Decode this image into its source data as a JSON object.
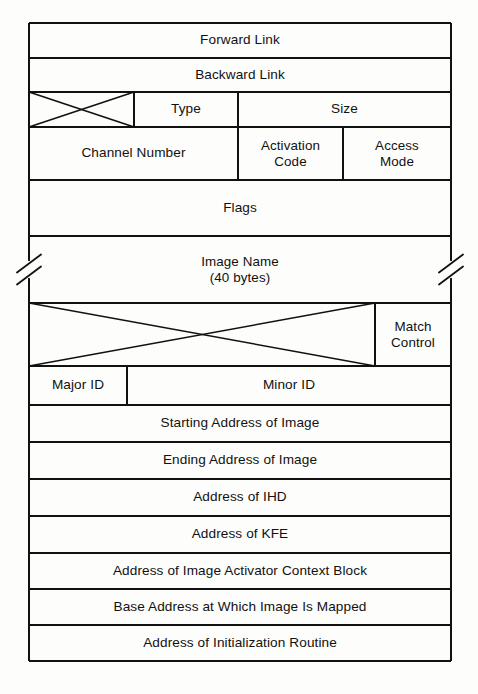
{
  "diagram": {
    "type": "memory-structure-layout",
    "colors": {
      "background": "#fdfdfb",
      "line": "#111111",
      "text": "#111111"
    },
    "geometry": {
      "left": 29,
      "right": 451,
      "top": 23,
      "bottom": 661
    },
    "rows": [
      {
        "name": "forward-link",
        "y": 23,
        "height": 35,
        "fields": [
          {
            "name": "forward-link",
            "label": "Forward Link",
            "x": 29,
            "width": 422,
            "kind": "text"
          }
        ]
      },
      {
        "name": "backward-link",
        "y": 58,
        "height": 34,
        "fields": [
          {
            "name": "backward-link",
            "label": "Backward Link",
            "x": 29,
            "width": 422,
            "kind": "text"
          }
        ]
      },
      {
        "name": "type-size",
        "y": 92,
        "height": 35,
        "fields": [
          {
            "name": "unused-crossed-box",
            "label": "",
            "x": 29,
            "width": 105,
            "kind": "crossed"
          },
          {
            "name": "type",
            "label": "Type",
            "x": 134,
            "width": 104,
            "kind": "text"
          },
          {
            "name": "size",
            "label": "Size",
            "x": 238,
            "width": 213,
            "kind": "text"
          }
        ]
      },
      {
        "name": "channel-activation-access",
        "y": 127,
        "height": 53,
        "fields": [
          {
            "name": "channel-number",
            "label": "Channel Number",
            "x": 29,
            "width": 209,
            "kind": "text"
          },
          {
            "name": "activation-code",
            "label": "Activation\nCode",
            "x": 238,
            "width": 105,
            "kind": "text"
          },
          {
            "name": "access-mode",
            "label": "Access\nMode",
            "x": 343,
            "width": 108,
            "kind": "text"
          }
        ]
      },
      {
        "name": "flags",
        "y": 180,
        "height": 56,
        "fields": [
          {
            "name": "flags",
            "label": "Flags",
            "x": 29,
            "width": 422,
            "kind": "text"
          }
        ]
      },
      {
        "name": "image-name",
        "y": 236,
        "height": 67,
        "breaks": true,
        "fields": [
          {
            "name": "image-name",
            "label": "Image Name\n(40 bytes)",
            "x": 29,
            "width": 422,
            "kind": "text"
          }
        ]
      },
      {
        "name": "match-control",
        "y": 303,
        "height": 63,
        "fields": [
          {
            "name": "unused-crossed-box-large",
            "label": "",
            "x": 29,
            "width": 346,
            "kind": "crossed"
          },
          {
            "name": "match-control",
            "label": "Match\nControl",
            "x": 375,
            "width": 76,
            "kind": "text"
          }
        ]
      },
      {
        "name": "major-minor-id",
        "y": 366,
        "height": 39,
        "fields": [
          {
            "name": "major-id",
            "label": "Major ID",
            "x": 29,
            "width": 98,
            "kind": "text"
          },
          {
            "name": "minor-id",
            "label": "Minor ID",
            "x": 127,
            "width": 324,
            "kind": "text"
          }
        ]
      },
      {
        "name": "starting-address",
        "y": 405,
        "height": 37,
        "fields": [
          {
            "name": "starting-address-of-image",
            "label": "Starting Address of Image",
            "x": 29,
            "width": 422,
            "kind": "text"
          }
        ]
      },
      {
        "name": "ending-address",
        "y": 442,
        "height": 37,
        "fields": [
          {
            "name": "ending-address-of-image",
            "label": "Ending Address of Image",
            "x": 29,
            "width": 422,
            "kind": "text"
          }
        ]
      },
      {
        "name": "address-ihd",
        "y": 479,
        "height": 37,
        "fields": [
          {
            "name": "address-of-ihd",
            "label": "Address of IHD",
            "x": 29,
            "width": 422,
            "kind": "text"
          }
        ]
      },
      {
        "name": "address-kfe",
        "y": 516,
        "height": 37,
        "fields": [
          {
            "name": "address-of-kfe",
            "label": "Address of KFE",
            "x": 29,
            "width": 422,
            "kind": "text"
          }
        ]
      },
      {
        "name": "address-iacb",
        "y": 553,
        "height": 36,
        "fields": [
          {
            "name": "address-of-image-activator-context-block",
            "label": "Address of Image Activator Context Block",
            "x": 29,
            "width": 422,
            "kind": "text"
          }
        ]
      },
      {
        "name": "base-address",
        "y": 589,
        "height": 36,
        "fields": [
          {
            "name": "base-address-at-which-image-is-mapped",
            "label": "Base Address at Which Image Is Mapped",
            "x": 29,
            "width": 422,
            "kind": "text"
          }
        ]
      },
      {
        "name": "address-init-routine",
        "y": 625,
        "height": 36,
        "fields": [
          {
            "name": "address-of-initialization-routine",
            "label": "Address of Initialization Routine",
            "x": 29,
            "width": 422,
            "kind": "text"
          }
        ]
      }
    ]
  }
}
